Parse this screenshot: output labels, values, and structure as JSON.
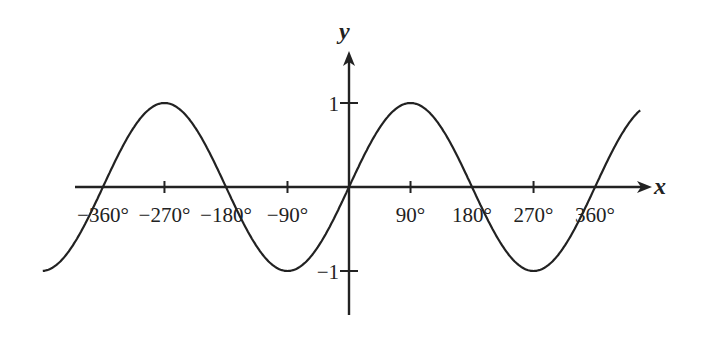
{
  "chart_data": {
    "type": "line",
    "title": "",
    "function": "y = sin x",
    "xlabel": "x",
    "ylabel": "y",
    "xlim": [
      -448,
      426
    ],
    "ylim": [
      -1.5,
      1.9
    ],
    "grid": false,
    "legend": null,
    "x_ticks": [
      -360,
      -270,
      -180,
      -90,
      90,
      180,
      270,
      360
    ],
    "x_tick_labels": [
      "−360°",
      "−270°",
      "−180°",
      "−90°",
      "90°",
      "180°",
      "270°",
      "360°"
    ],
    "y_ticks": [
      1,
      -1
    ],
    "y_tick_labels": [
      "1",
      "−1"
    ],
    "series": [
      {
        "name": "sin x",
        "x": [
          -448,
          -360,
          -270,
          -180,
          -90,
          0,
          90,
          180,
          270,
          360,
          426
        ],
        "values": [
          -1.0,
          0,
          1,
          0,
          -1,
          0,
          1,
          0,
          -1,
          0,
          1.0
        ]
      }
    ],
    "color": "#222222"
  }
}
